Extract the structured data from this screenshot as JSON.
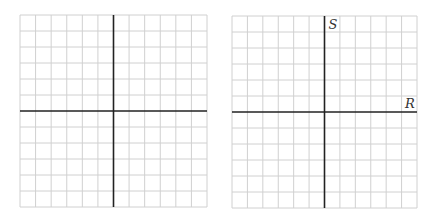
{
  "diagram": {
    "type": "blank coordinate grids",
    "grid_color": "#d0d0d0",
    "axis_color": "#222222",
    "grids": [
      {
        "name": "left-grid",
        "columns": 12,
        "rows": 12,
        "axis_column": 6,
        "axis_row": 6,
        "x_label": "",
        "y_label": ""
      },
      {
        "name": "right-grid",
        "columns": 12,
        "rows": 12,
        "axis_column": 6,
        "axis_row": 6,
        "x_label": "R",
        "y_label": "S"
      }
    ]
  }
}
